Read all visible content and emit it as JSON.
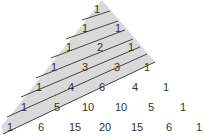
{
  "diagram": {
    "colors": {
      "shade": "#d9d9d9",
      "line": "#444444",
      "text": "#333333"
    },
    "rows": [
      [
        1
      ],
      [
        1,
        1
      ],
      [
        1,
        2,
        1
      ],
      [
        1,
        3,
        3,
        1
      ],
      [
        1,
        4,
        6,
        4,
        1
      ],
      [
        1,
        5,
        10,
        10,
        5,
        1
      ],
      [
        1,
        6,
        15,
        20,
        15,
        6,
        1
      ]
    ],
    "numbers": [
      {
        "label": "1",
        "x": 97,
        "y": 9
      },
      {
        "label": "1",
        "x": 85,
        "y": 28
      },
      {
        "label": "1",
        "x": 118,
        "y": 28
      },
      {
        "label": "1",
        "x": 69,
        "y": 47
      },
      {
        "label": "2",
        "x": 100,
        "y": 47
      },
      {
        "label": "1",
        "x": 131,
        "y": 47
      },
      {
        "label": "1",
        "x": 54,
        "y": 67
      },
      {
        "label": "3",
        "x": 85,
        "y": 67
      },
      {
        "label": "3",
        "x": 117,
        "y": 67
      },
      {
        "label": "1",
        "x": 147,
        "y": 67
      },
      {
        "label": "1",
        "x": 39,
        "y": 87
      },
      {
        "label": "4",
        "x": 71,
        "y": 87
      },
      {
        "label": "6",
        "x": 102,
        "y": 87
      },
      {
        "label": "4",
        "x": 135,
        "y": 87
      },
      {
        "label": "1",
        "x": 166,
        "y": 87
      },
      {
        "label": "1",
        "x": 24,
        "y": 107
      },
      {
        "label": "5",
        "x": 57,
        "y": 107
      },
      {
        "label": "10",
        "x": 88,
        "y": 107
      },
      {
        "label": "10",
        "x": 121,
        "y": 107
      },
      {
        "label": "5",
        "x": 151,
        "y": 107
      },
      {
        "label": "1",
        "x": 183,
        "y": 107
      },
      {
        "label": "1",
        "x": 10,
        "y": 127
      },
      {
        "label": "6",
        "x": 41,
        "y": 127
      },
      {
        "label": "15",
        "x": 75,
        "y": 127
      },
      {
        "label": "20",
        "x": 105,
        "y": 127
      },
      {
        "label": "15",
        "x": 137,
        "y": 127
      },
      {
        "label": "6",
        "x": 169,
        "y": 127
      },
      {
        "label": "1",
        "x": 199,
        "y": 127
      }
    ],
    "shaded_region": [
      [
        102,
        0
      ],
      [
        155,
        62
      ],
      [
        4,
        134
      ],
      [
        1,
        127
      ]
    ],
    "diagonals": [
      [
        [
          82,
          20
        ],
        [
          110,
          11
        ]
      ],
      [
        [
          66,
          39
        ],
        [
          118,
          21
        ]
      ],
      [
        [
          51,
          58
        ],
        [
          125,
          30
        ]
      ],
      [
        [
          36,
          78
        ],
        [
          133,
          39
        ]
      ],
      [
        [
          21,
          97
        ],
        [
          140,
          47
        ]
      ],
      [
        [
          7,
          117
        ],
        [
          147,
          54
        ]
      ],
      [
        [
          3,
          134
        ],
        [
          155,
          62
        ]
      ]
    ]
  }
}
